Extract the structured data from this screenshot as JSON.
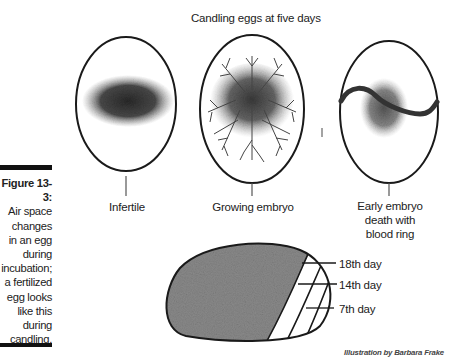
{
  "figure": {
    "title": "Candling eggs at five days",
    "caption_label": "Figure 13-3:",
    "caption_text": "Air space changes in an egg during incubation; a fertilized egg looks like this during candling.",
    "caption_lines": [
      "Air space",
      "changes",
      "in an egg",
      "during",
      "incubation;",
      "a fertilized",
      "egg looks",
      "like this",
      "during",
      "candling."
    ],
    "credit": "Illustration by Barbara Frake"
  },
  "eggs": [
    {
      "label": "Infertile"
    },
    {
      "label": "Growing embryo"
    },
    {
      "label_lines": [
        "Early embryo",
        "death with",
        "blood ring"
      ]
    }
  ],
  "air_space": {
    "labels": [
      "18th day",
      "14th day",
      "7th day"
    ]
  },
  "colors": {
    "outline": "#1a1a1a",
    "shading": "#555555",
    "caption_bar": "#111111"
  }
}
